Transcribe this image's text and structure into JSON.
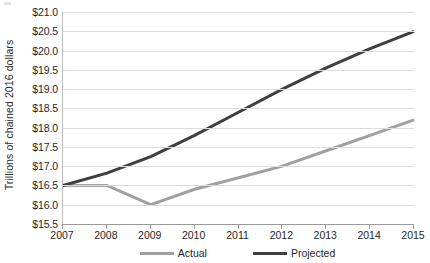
{
  "chart_data": {
    "type": "line",
    "title": "",
    "xlabel": "",
    "ylabel": "Trillions of chained 2016 dollars",
    "x": [
      2007,
      2008,
      2009,
      2010,
      2011,
      2012,
      2013,
      2014,
      2015
    ],
    "xtick_labels": [
      "2007",
      "2008",
      "2009",
      "2010",
      "2011",
      "2012",
      "2013",
      "2014",
      "2015"
    ],
    "xlim": [
      2007,
      2015
    ],
    "ylim": [
      15.5,
      21.0
    ],
    "ytick_values": [
      15.5,
      16.0,
      16.5,
      17.0,
      17.5,
      18.0,
      18.5,
      19.0,
      19.5,
      20.0,
      20.5,
      21.0
    ],
    "ytick_labels": [
      "$15.5",
      "$16.0",
      "$16.5",
      "$17.0",
      "$17.5",
      "$18.0",
      "$18.5",
      "$19.0",
      "$19.5",
      "$20.0",
      "$20.5",
      "$21.0"
    ],
    "grid": "horizontal",
    "legend_position": "bottom",
    "series": [
      {
        "name": "Actual",
        "color": "#a0a0a0",
        "width": 3,
        "values": [
          16.5,
          16.5,
          16.0,
          16.4,
          16.7,
          17.0,
          17.4,
          17.8,
          18.2
        ]
      },
      {
        "name": "Projected",
        "color": "#3f3f3f",
        "width": 3,
        "values": [
          16.5,
          16.82,
          17.25,
          17.8,
          18.4,
          19.0,
          19.55,
          20.05,
          20.5
        ]
      }
    ]
  },
  "legend": {
    "items": [
      {
        "label": "Actual",
        "color": "#a0a0a0"
      },
      {
        "label": "Projected",
        "color": "#3f3f3f"
      }
    ]
  },
  "axis": {
    "y_title": "Trillions of chained 2016 dollars"
  }
}
